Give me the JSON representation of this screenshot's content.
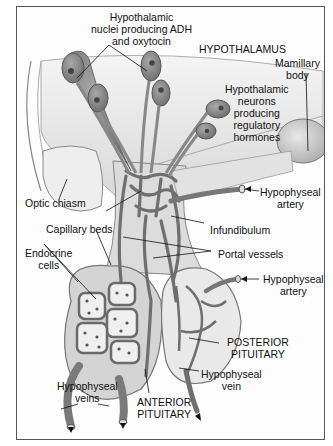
{
  "diagram": {
    "labels": {
      "adh_nuclei": [
        "Hypothalamic",
        "nuclei producing ADH",
        "and oxytocin"
      ],
      "hypothalamus": "HYPOTHALAMUS",
      "mamillary_body": [
        "Mamillary",
        "body"
      ],
      "regulatory_neurons": [
        "Hypothalamic",
        "neurons",
        "producing",
        "regulatory",
        "hormones"
      ],
      "optic_chiasm": "Optic chiasm",
      "hypophyseal_artery_upper": [
        "Hypophyseal",
        "artery"
      ],
      "capillary_beds": "Capillary beds",
      "infundibulum": "Infundibulum",
      "endocrine_cells": [
        "Endocrine",
        "cells"
      ],
      "portal_vessels": "Portal vessels",
      "hypophyseal_artery_lower": [
        "Hypophyseal",
        "artery"
      ],
      "posterior_pituitary": [
        "POSTERIOR",
        "PITUITARY"
      ],
      "hypophyseal_vein": [
        "Hypophyseal",
        "vein"
      ],
      "hypophyseal_veins": [
        "Hypophyseal",
        "veins"
      ],
      "anterior_pituitary": [
        "ANTERIOR",
        "PITUITARY"
      ]
    },
    "colors": {
      "tissue_light": "#e6e6e6",
      "tissue_mid": "#bdbdbd",
      "vessel": "#7a7a7a",
      "vessel_dark": "#4a4a4a",
      "neuron": "#8c8c8c",
      "line": "#111111"
    }
  }
}
